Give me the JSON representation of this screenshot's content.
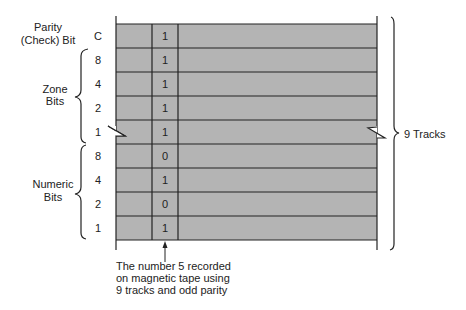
{
  "diagram": {
    "grid_fill": "#b4b4b4",
    "line_color": "#222222",
    "rows": [
      {
        "track": "C",
        "value": "1"
      },
      {
        "track": "8",
        "value": "1"
      },
      {
        "track": "4",
        "value": "1"
      },
      {
        "track": "2",
        "value": "1"
      },
      {
        "track": "1",
        "value": "1"
      },
      {
        "track": "8",
        "value": "0"
      },
      {
        "track": "4",
        "value": "1"
      },
      {
        "track": "2",
        "value": "0"
      },
      {
        "track": "1",
        "value": "1"
      }
    ],
    "labels": {
      "parity_line1": "Parity",
      "parity_line2": "(Check) Bit",
      "zone_line1": "Zone",
      "zone_line2": "Bits",
      "numeric_line1": "Numeric",
      "numeric_line2": "Bits",
      "tracks": "9 Tracks"
    },
    "caption": {
      "line1": "The number 5 recorded",
      "line2": "on magnetic tape using",
      "line3": "9 tracks and odd parity"
    }
  }
}
